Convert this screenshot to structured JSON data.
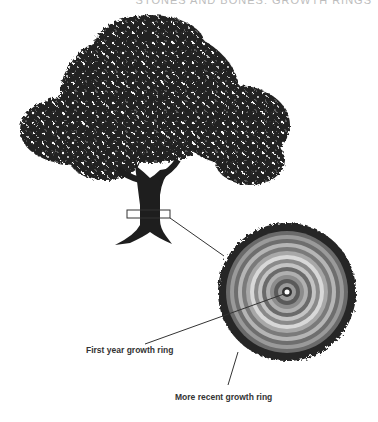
{
  "header": {
    "text": "STONES AND BONES: GROWTH RINGS"
  },
  "diagram": {
    "labels": {
      "first_ring": "First year growth ring",
      "recent_ring": "More recent growth ring"
    },
    "colors": {
      "ink": "#1e1e1e",
      "ring_dark": "#555555",
      "ring_mid": "#8a8a8a",
      "ring_light": "#c8c8c8"
    }
  }
}
